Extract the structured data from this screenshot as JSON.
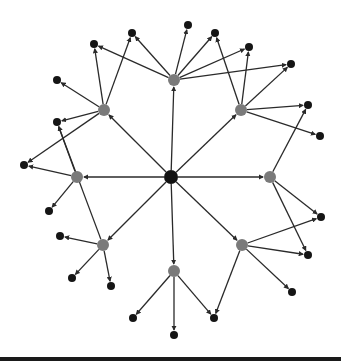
{
  "diagram": {
    "type": "directed-network",
    "colors": {
      "center": "#111111",
      "hub": "#7a7a7a",
      "leaf": "#151515",
      "edge": "#2a2a2a",
      "background": "#ffffff"
    },
    "nodes": [
      {
        "id": "C",
        "role": "center",
        "x": 171,
        "y": 177,
        "r": 7
      },
      {
        "id": "H1",
        "role": "hub",
        "x": 174,
        "y": 80,
        "r": 6
      },
      {
        "id": "H2",
        "role": "hub",
        "x": 241,
        "y": 110,
        "r": 6
      },
      {
        "id": "H3",
        "role": "hub",
        "x": 270,
        "y": 177,
        "r": 6
      },
      {
        "id": "H4",
        "role": "hub",
        "x": 242,
        "y": 245,
        "r": 6
      },
      {
        "id": "H5",
        "role": "hub",
        "x": 174,
        "y": 271,
        "r": 6
      },
      {
        "id": "H6",
        "role": "hub",
        "x": 103,
        "y": 245,
        "r": 6
      },
      {
        "id": "H7",
        "role": "hub",
        "x": 77,
        "y": 177,
        "r": 6
      },
      {
        "id": "H8",
        "role": "hub",
        "x": 104,
        "y": 110,
        "r": 6
      },
      {
        "id": "L1",
        "role": "leaf",
        "x": 188,
        "y": 25,
        "r": 4
      },
      {
        "id": "L2",
        "role": "leaf",
        "x": 215,
        "y": 33,
        "r": 4
      },
      {
        "id": "L3",
        "role": "leaf",
        "x": 249,
        "y": 47,
        "r": 4
      },
      {
        "id": "L4",
        "role": "leaf",
        "x": 291,
        "y": 64,
        "r": 4
      },
      {
        "id": "L5",
        "role": "leaf",
        "x": 308,
        "y": 105,
        "r": 4
      },
      {
        "id": "L6",
        "role": "leaf",
        "x": 320,
        "y": 136,
        "r": 4
      },
      {
        "id": "L7",
        "role": "leaf",
        "x": 321,
        "y": 217,
        "r": 4
      },
      {
        "id": "L8",
        "role": "leaf",
        "x": 308,
        "y": 255,
        "r": 4
      },
      {
        "id": "L9",
        "role": "leaf",
        "x": 292,
        "y": 292,
        "r": 4
      },
      {
        "id": "L10",
        "role": "leaf",
        "x": 214,
        "y": 318,
        "r": 4
      },
      {
        "id": "L11",
        "role": "leaf",
        "x": 174,
        "y": 335,
        "r": 4
      },
      {
        "id": "L12",
        "role": "leaf",
        "x": 133,
        "y": 318,
        "r": 4
      },
      {
        "id": "L13",
        "role": "leaf",
        "x": 111,
        "y": 286,
        "r": 4
      },
      {
        "id": "L14",
        "role": "leaf",
        "x": 72,
        "y": 278,
        "r": 4
      },
      {
        "id": "L15",
        "role": "leaf",
        "x": 60,
        "y": 236,
        "r": 4
      },
      {
        "id": "L16",
        "role": "leaf",
        "x": 49,
        "y": 211,
        "r": 4
      },
      {
        "id": "L17",
        "role": "leaf",
        "x": 24,
        "y": 165,
        "r": 4
      },
      {
        "id": "L18",
        "role": "leaf",
        "x": 57,
        "y": 122,
        "r": 4
      },
      {
        "id": "L19",
        "role": "leaf",
        "x": 57,
        "y": 80,
        "r": 4
      },
      {
        "id": "L20",
        "role": "leaf",
        "x": 94,
        "y": 44,
        "r": 4
      },
      {
        "id": "L21",
        "role": "leaf",
        "x": 132,
        "y": 33,
        "r": 4
      }
    ],
    "edges": [
      {
        "from": "C",
        "to": "H1"
      },
      {
        "from": "C",
        "to": "H2"
      },
      {
        "from": "C",
        "to": "H3"
      },
      {
        "from": "C",
        "to": "H4"
      },
      {
        "from": "C",
        "to": "H5"
      },
      {
        "from": "C",
        "to": "H6"
      },
      {
        "from": "C",
        "to": "H7"
      },
      {
        "from": "C",
        "to": "H8"
      },
      {
        "from": "H1",
        "to": "L1"
      },
      {
        "from": "H1",
        "to": "L2"
      },
      {
        "from": "H1",
        "to": "L3"
      },
      {
        "from": "H1",
        "to": "L21"
      },
      {
        "from": "H1",
        "to": "L20"
      },
      {
        "from": "H1",
        "to": "L4"
      },
      {
        "from": "H2",
        "to": "L3"
      },
      {
        "from": "H2",
        "to": "L4"
      },
      {
        "from": "H2",
        "to": "L5"
      },
      {
        "from": "H2",
        "to": "L6"
      },
      {
        "from": "H2",
        "to": "L2"
      },
      {
        "from": "H3",
        "to": "L5"
      },
      {
        "from": "H3",
        "to": "L7"
      },
      {
        "from": "H3",
        "to": "L8"
      },
      {
        "from": "H4",
        "to": "L7"
      },
      {
        "from": "H4",
        "to": "L8"
      },
      {
        "from": "H4",
        "to": "L9"
      },
      {
        "from": "H4",
        "to": "L10"
      },
      {
        "from": "H5",
        "to": "L10"
      },
      {
        "from": "H5",
        "to": "L11"
      },
      {
        "from": "H5",
        "to": "L12"
      },
      {
        "from": "H6",
        "to": "L13"
      },
      {
        "from": "H6",
        "to": "L14"
      },
      {
        "from": "H6",
        "to": "L15"
      },
      {
        "from": "H6",
        "to": "L18"
      },
      {
        "from": "H7",
        "to": "L16"
      },
      {
        "from": "H7",
        "to": "L17"
      },
      {
        "from": "H7",
        "to": "L18"
      },
      {
        "from": "H8",
        "to": "L17"
      },
      {
        "from": "H8",
        "to": "L18"
      },
      {
        "from": "H8",
        "to": "L19"
      },
      {
        "from": "H8",
        "to": "L20"
      },
      {
        "from": "H8",
        "to": "L21"
      }
    ]
  }
}
